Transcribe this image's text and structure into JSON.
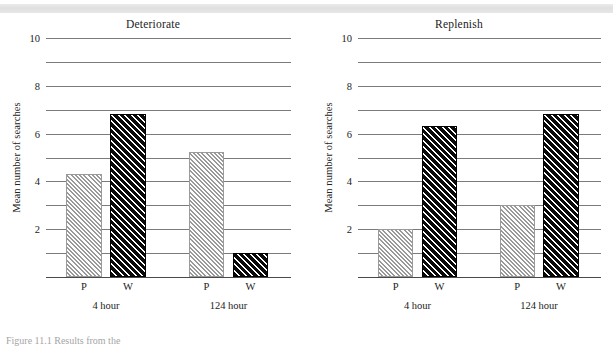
{
  "figure": {
    "caption_fragment": "Figure 11.1   Results from the",
    "scan_band": true
  },
  "axis": {
    "ylabel": "Mean number of searches",
    "ytick_labels": [
      "2",
      "4",
      "6",
      "8",
      "10"
    ],
    "ymin": 0,
    "ymax": 10,
    "gridline_step": 1
  },
  "group_labels": [
    "4 hour",
    "124 hour"
  ],
  "bar_labels": [
    "P",
    "W",
    "P",
    "W"
  ],
  "colors": {
    "light_bar": "#d2d2d2",
    "dark_bar": "#101010",
    "gridline": "#7b7b7b",
    "text": "#1b1b1b",
    "scan_band": "#e1e1e1"
  },
  "chart_data": [
    {
      "type": "bar",
      "title": "Deteriorate",
      "xlabel": "",
      "ylabel": "Mean number of searches",
      "ylim": [
        0,
        10
      ],
      "grid": true,
      "legend": "none",
      "categories": [
        "P",
        "W",
        "P",
        "W"
      ],
      "groups": [
        "4 hour",
        "4 hour",
        "124 hour",
        "124 hour"
      ],
      "values": [
        4.3,
        6.8,
        5.25,
        1.0
      ],
      "fills": [
        "light",
        "dark",
        "light",
        "dark"
      ]
    },
    {
      "type": "bar",
      "title": "Replenish",
      "xlabel": "",
      "ylabel": "Mean number of searches",
      "ylim": [
        0,
        10
      ],
      "grid": true,
      "legend": "none",
      "categories": [
        "P",
        "W",
        "P",
        "W"
      ],
      "groups": [
        "4 hour",
        "4 hour",
        "124 hour",
        "124 hour"
      ],
      "values": [
        2.0,
        6.3,
        3.0,
        6.8
      ],
      "fills": [
        "light",
        "dark",
        "light",
        "dark"
      ]
    }
  ]
}
